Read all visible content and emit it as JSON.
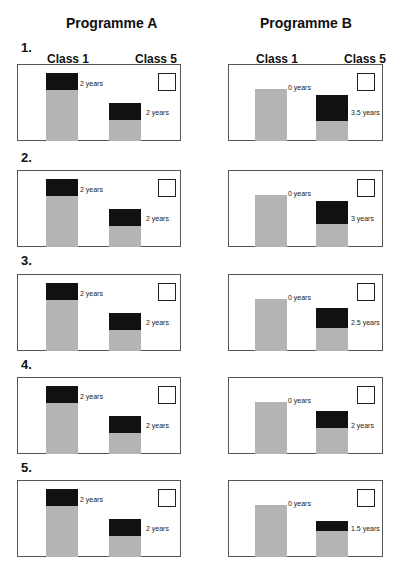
{
  "programmes": [
    {
      "title": "Programme A",
      "class_left": "Class 1",
      "class_right": "Class 5"
    },
    {
      "title": "Programme B",
      "class_left": "Class 1",
      "class_right": "Class 5"
    }
  ],
  "rows": [
    {
      "num": "1.",
      "a_left": "2 years",
      "a_right": "2 years",
      "b_left": "0 years",
      "b_right": "3.5 years"
    },
    {
      "num": "2.",
      "a_left": "2 years",
      "a_right": "2 years",
      "b_left": "0 years",
      "b_right": "3 years"
    },
    {
      "num": "3.",
      "a_left": "2 years",
      "a_right": "2 years",
      "b_left": "0 years",
      "b_right": "2.5 years"
    },
    {
      "num": "4.",
      "a_left": "2 years",
      "a_right": "2 years",
      "b_left": "0 years",
      "b_right": "2 years"
    },
    {
      "num": "5.",
      "a_left": "2 years",
      "a_right": "2 years",
      "b_left": "0 years",
      "b_right": "1.5 years"
    }
  ],
  "colors": {
    "grey": "#b4b4b4",
    "black": "#111111",
    "border": "#555555"
  }
}
